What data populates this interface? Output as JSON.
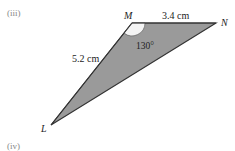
{
  "part_labels": {
    "top": "(iii)",
    "bottom": "(iv)"
  },
  "triangle": {
    "vertices": {
      "L": "L",
      "M": "M",
      "N": "N"
    },
    "sides": {
      "LM": "5.2 cm",
      "MN": "3.4 cm"
    },
    "angle_M": "130°",
    "fill_color": "#9a9a9a",
    "stroke_color": "#333333",
    "angle_arc_color": "#ffffff"
  }
}
